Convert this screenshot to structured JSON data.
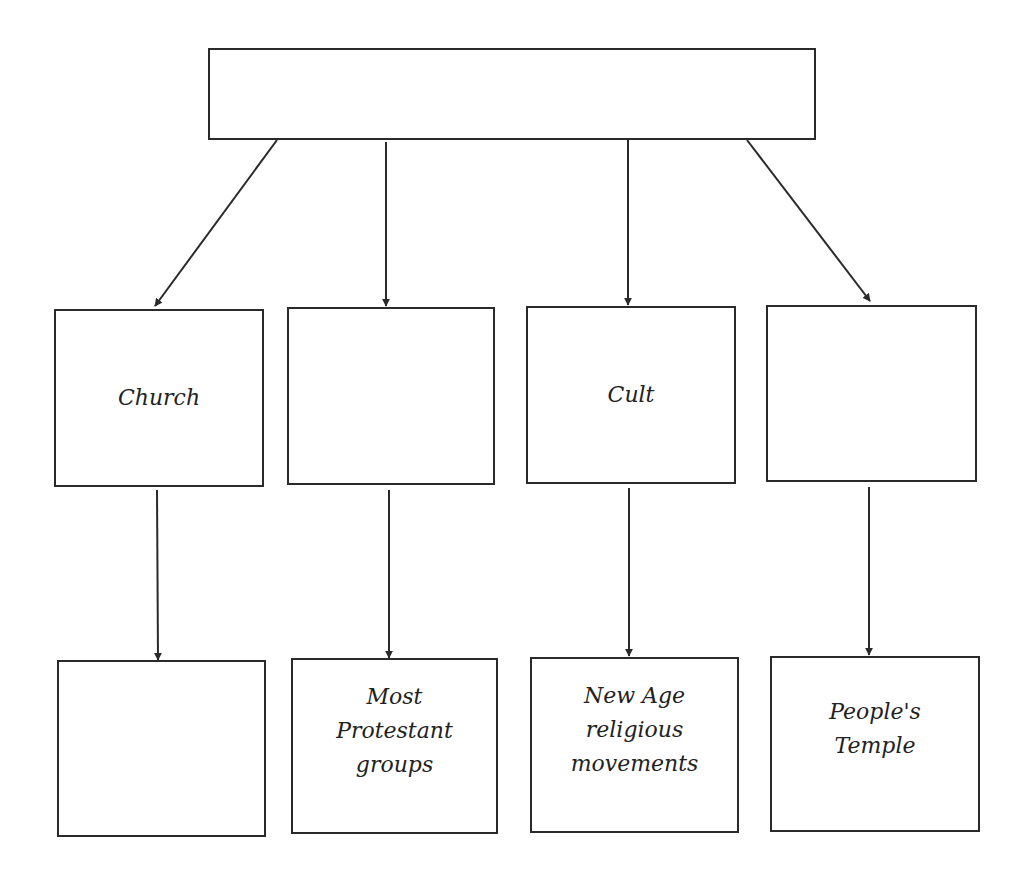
{
  "diagram": {
    "root": {
      "label": ""
    },
    "level1": [
      {
        "label": "Church"
      },
      {
        "label": ""
      },
      {
        "label": "Cult"
      },
      {
        "label": ""
      }
    ],
    "level2": [
      {
        "label": ""
      },
      {
        "label": "Most\nProtestant\ngroups"
      },
      {
        "label": "New Age\nreligious\nmovements"
      },
      {
        "label": "People's\nTemple"
      }
    ],
    "colors": {
      "stroke": "#2a2a2a",
      "background": "#ffffff",
      "text": "#222222"
    }
  }
}
